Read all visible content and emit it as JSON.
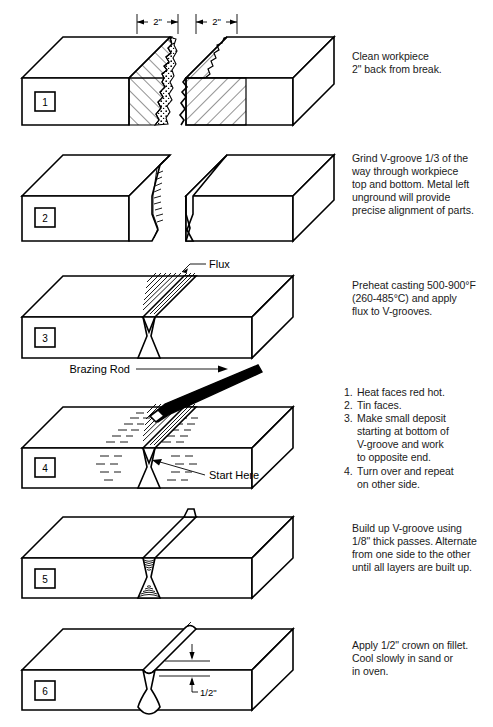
{
  "document": {
    "title": "Brazing / Welding Repair Procedure — 6 Step Illustrated Guide",
    "panel_count": 6
  },
  "panels": [
    {
      "step": "1",
      "caption_lines": [
        "Clean workpiece",
        "2\" back from break."
      ],
      "dimension_labels": [
        "2\"",
        "2\""
      ],
      "annotations": []
    },
    {
      "step": "2",
      "caption_lines": [
        "Grind V-groove 1/3 of the",
        "way through workpiece",
        "top and bottom. Metal left",
        "unground will provide",
        "precise alignment of parts."
      ],
      "dimension_labels": [],
      "annotations": []
    },
    {
      "step": "3",
      "caption_lines": [
        "Preheat casting 500-900°F",
        "(260-485°C) and apply",
        "flux to V-grooves."
      ],
      "dimension_labels": [],
      "annotations": [
        "Flux"
      ]
    },
    {
      "step": "4",
      "caption_list": [
        {
          "num": "1.",
          "lines": [
            "Heat faces red hot."
          ]
        },
        {
          "num": "2.",
          "lines": [
            "Tin faces."
          ]
        },
        {
          "num": "3.",
          "lines": [
            "Make small deposit",
            "starting at bottom of",
            "V-groove and work",
            "to opposite end."
          ]
        },
        {
          "num": "4.",
          "lines": [
            "Turn over and repeat",
            "on other side."
          ]
        }
      ],
      "dimension_labels": [],
      "annotations": [
        "Brazing Rod",
        "Start Here"
      ]
    },
    {
      "step": "5",
      "caption_lines": [
        "Build up V-groove using",
        "1/8\" thick passes. Alternate",
        "from one side to the other",
        "until all layers are built up."
      ],
      "dimension_labels": [],
      "annotations": []
    },
    {
      "step": "6",
      "caption_lines": [
        "Apply 1/2\" crown on fillet.",
        "Cool slowly in sand or",
        "in oven."
      ],
      "dimension_labels": [
        "1/2\""
      ],
      "annotations": []
    }
  ],
  "colors": {
    "ink": "#000000",
    "background": "#ffffff",
    "rod_fill": "#000000"
  }
}
